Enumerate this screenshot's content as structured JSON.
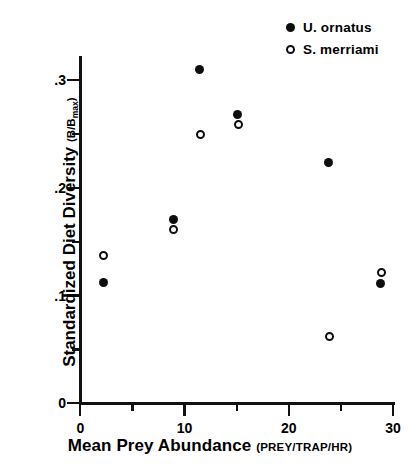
{
  "chart_data": {
    "type": "scatter",
    "title": "",
    "xlabel": "Mean Prey Abundance",
    "xlabel_units": "(PREY/TRAP/HR)",
    "ylabel": "Standardized Diet Diversity",
    "ylabel_units": "(B/Bmax)",
    "xlim": [
      0,
      30
    ],
    "ylim": [
      0,
      0.33
    ],
    "grid": false,
    "legend_position": "top-right",
    "x_ticks": [
      0,
      10,
      20,
      30
    ],
    "x_tick_labels": [
      "0",
      "10",
      "20",
      "30"
    ],
    "x_minor_ticks": [
      5,
      15,
      25
    ],
    "y_ticks": [
      0,
      0.1,
      0.2,
      0.3
    ],
    "y_tick_labels": [
      "0",
      ".1",
      ".2",
      ".3"
    ],
    "y_minor_ticks": [
      0.05,
      0.15,
      0.25
    ],
    "series": [
      {
        "name": "U. ornatus",
        "marker": "filled-circle",
        "color": "#0d0d0d",
        "points": [
          {
            "x": 2.2,
            "y": 0.112
          },
          {
            "x": 8.9,
            "y": 0.171
          },
          {
            "x": 11.4,
            "y": 0.31
          },
          {
            "x": 15.1,
            "y": 0.268
          },
          {
            "x": 23.8,
            "y": 0.223
          },
          {
            "x": 28.8,
            "y": 0.111
          }
        ]
      },
      {
        "name": "S. merriami",
        "marker": "open-circle",
        "color": "#0d0d0d",
        "points": [
          {
            "x": 2.2,
            "y": 0.137
          },
          {
            "x": 8.9,
            "y": 0.161
          },
          {
            "x": 11.5,
            "y": 0.249
          },
          {
            "x": 15.2,
            "y": 0.259
          },
          {
            "x": 23.9,
            "y": 0.062
          },
          {
            "x": 28.9,
            "y": 0.121
          }
        ]
      }
    ]
  },
  "legend": {
    "items": [
      {
        "label": "U. ornatus",
        "marker": "filled-circle"
      },
      {
        "label": "S. merriami",
        "marker": "open-circle"
      }
    ]
  },
  "axes": {
    "x_title_main": "Mean Prey Abundance",
    "x_title_units": "(PREY/TRAP/HR)",
    "y_title_main": "Standardized Diet Diversity",
    "y_title_units_open": "(B/B",
    "y_title_units_sub": "max",
    "y_title_units_close": ")"
  }
}
